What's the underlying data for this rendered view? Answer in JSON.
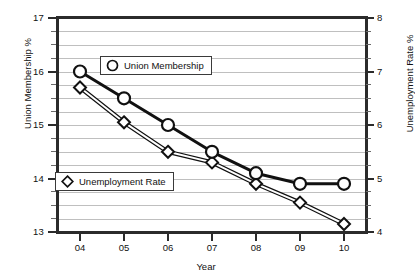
{
  "chart_data": {
    "type": "line",
    "title": "",
    "xlabel": "Year",
    "categories": [
      "04",
      "05",
      "06",
      "07",
      "08",
      "09",
      "10"
    ],
    "grid": true,
    "legend_position": "inside-plot",
    "series": [
      {
        "name": "Union Membership",
        "marker": "circle",
        "axis": "left",
        "ylabel": "Union Membership %",
        "ylim": [
          13,
          17
        ],
        "yticks": [
          13,
          14,
          15,
          16,
          17
        ],
        "values": [
          16.0,
          15.5,
          15.0,
          14.5,
          14.1,
          13.9,
          13.9
        ]
      },
      {
        "name": "Unemployment Rate",
        "marker": "diamond",
        "axis": "right",
        "ylabel": "Unemployment Rate %",
        "ylim": [
          4,
          8
        ],
        "yticks": [
          4,
          5,
          6,
          7,
          8
        ],
        "values": [
          6.7,
          6.05,
          5.5,
          5.3,
          4.9,
          4.55,
          4.15
        ]
      }
    ]
  },
  "axes": {
    "left": {
      "title": "Union Membership %",
      "ticks": [
        "17",
        "16",
        "15",
        "14",
        "13"
      ]
    },
    "right": {
      "title": "Unemployment Rate %",
      "ticks": [
        "8",
        "7",
        "6",
        "5",
        "4"
      ]
    },
    "bottom": {
      "title": "Year",
      "ticks": [
        "04",
        "05",
        "06",
        "07",
        "08",
        "09",
        "10"
      ]
    }
  },
  "legend": {
    "union": {
      "label": "Union Membership",
      "marker": "circle-marker-icon"
    },
    "unemployment": {
      "label": "Unemployment Rate",
      "marker": "diamond-marker-icon"
    }
  },
  "colors": {
    "line": "#1a1a1a",
    "grid": "#bfbfbf",
    "axis": "#2b2b2b",
    "marker_fill": "#ffffff"
  }
}
